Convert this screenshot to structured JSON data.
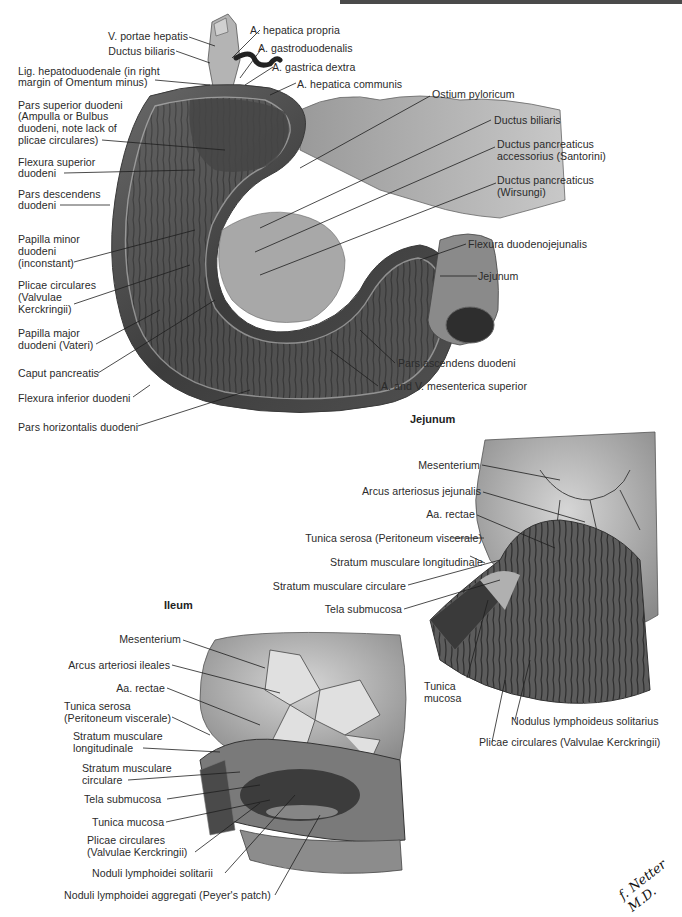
{
  "page": {
    "header_bar_color": "#4a4a4a",
    "signature": "f. Netter M.D."
  },
  "duodenum": {
    "labels": [
      {
        "text": "V. portae hepatis"
      },
      {
        "text": "Ductus biliaris"
      },
      {
        "text": "Lig. hepatoduodenale (in right"
      },
      {
        "text": "margin of Omentum minus)"
      },
      {
        "text": "Pars superior duodeni"
      },
      {
        "text": "(Ampulla or Bulbus"
      },
      {
        "text": "duodeni, note lack of"
      },
      {
        "text": "plicae circulares)"
      },
      {
        "text": "Flexura superior"
      },
      {
        "text": "duodeni"
      },
      {
        "text": "Pars descendens"
      },
      {
        "text": "duodeni"
      },
      {
        "text": "Papilla minor"
      },
      {
        "text": "duodeni"
      },
      {
        "text": "(inconstant)"
      },
      {
        "text": "Plicae circulares"
      },
      {
        "text": "(Valvulae"
      },
      {
        "text": "Kerckringii)"
      },
      {
        "text": "Papilla major"
      },
      {
        "text": "duodeni (Vateri)"
      },
      {
        "text": "Caput pancreatis"
      },
      {
        "text": "Flexura inferior duodeni"
      },
      {
        "text": "Pars horizontalis duodeni"
      },
      {
        "text": "A. hepatica propria"
      },
      {
        "text": "A. gastroduodenalis"
      },
      {
        "text": "A. gastrica dextra"
      },
      {
        "text": "A. hepatica communis"
      },
      {
        "text": "Ostium pyloricum"
      },
      {
        "text": "Ductus biliaris"
      },
      {
        "text": "Ductus pancreaticus"
      },
      {
        "text": "accessorius (Santorini)"
      },
      {
        "text": "Ductus pancreaticus"
      },
      {
        "text": "(Wirsungi)"
      },
      {
        "text": "Flexura duodenojejunalis"
      },
      {
        "text": "Jejunum"
      },
      {
        "text": "Pars ascendens duodeni"
      },
      {
        "text": "A. and V. mesenterica superior"
      }
    ]
  },
  "jejunum": {
    "title": "Jejunum",
    "labels": [
      {
        "text": "Mesenterium"
      },
      {
        "text": "Arcus arteriosus jejunalis"
      },
      {
        "text": "Aa. rectae"
      },
      {
        "text": "Tunica serosa (Peritoneum viscerale)"
      },
      {
        "text": "Stratum musculare longitudinale"
      },
      {
        "text": "Stratum musculare circulare"
      },
      {
        "text": "Tela submucosa"
      },
      {
        "text": "Tunica"
      },
      {
        "text": "mucosa"
      },
      {
        "text": "Nodulus lymphoideus solitarius"
      },
      {
        "text": "Plicae circulares (Valvulae Kerckringii)"
      }
    ]
  },
  "ileum": {
    "title": "Ileum",
    "labels": [
      {
        "text": "Mesenterium"
      },
      {
        "text": "Arcus arteriosi ileales"
      },
      {
        "text": "Aa. rectae"
      },
      {
        "text": "Tunica serosa"
      },
      {
        "text": "(Peritoneum viscerale)"
      },
      {
        "text": "Stratum musculare"
      },
      {
        "text": "longitudinale"
      },
      {
        "text": "Stratum musculare"
      },
      {
        "text": "circulare"
      },
      {
        "text": "Tela submucosa"
      },
      {
        "text": "Tunica mucosa"
      },
      {
        "text": "Plicae circulares"
      },
      {
        "text": "(Valvulae Kerckringii)"
      },
      {
        "text": "Noduli lymphoidei solitarii"
      },
      {
        "text": "Noduli lymphoidei aggregati (Peyer's patch)"
      }
    ]
  }
}
